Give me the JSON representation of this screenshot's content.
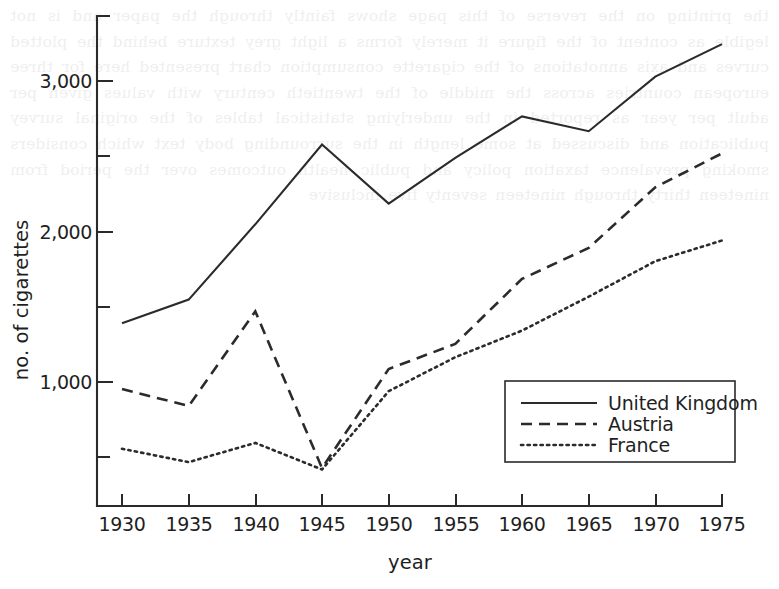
{
  "chart_data": {
    "type": "line",
    "title": "",
    "xlabel": "year",
    "ylabel": "no. of cigarettes",
    "x": [
      1930,
      1935,
      1940,
      1945,
      1950,
      1955,
      1960,
      1965,
      1970,
      1975
    ],
    "xlim": [
      1930,
      1975
    ],
    "ylim": [
      0,
      3500
    ],
    "y_major_ticks": [
      1000,
      2000,
      3000
    ],
    "y_major_tick_labels": [
      "1,000",
      "2,000",
      "3,000"
    ],
    "y_minor_ticks": [
      500,
      1500,
      2500,
      3500
    ],
    "x_tick_labels": [
      "1930",
      "1935",
      "1940",
      "1945",
      "1950",
      "1955",
      "1960",
      "1965",
      "1970",
      "1975"
    ],
    "grid": false,
    "legend_position": "lower right",
    "series": [
      {
        "name": "United Kingdom",
        "style": "solid",
        "values": [
          1420,
          1580,
          2090,
          2630,
          2230,
          2540,
          2820,
          2720,
          3090,
          3310
        ]
      },
      {
        "name": "Austria",
        "style": "dashed",
        "values": [
          975,
          860,
          1500,
          440,
          1110,
          1280,
          1720,
          1930,
          2340,
          2570
        ]
      },
      {
        "name": "France",
        "style": "dotted",
        "values": [
          570,
          480,
          610,
          430,
          960,
          1190,
          1370,
          1600,
          1840,
          1980
        ]
      }
    ]
  },
  "legend": {
    "entries": [
      {
        "label": "United Kingdom",
        "style": "solid"
      },
      {
        "label": "Austria",
        "style": "dashed"
      },
      {
        "label": "France",
        "style": "dotted"
      }
    ]
  },
  "page": {
    "bleed_text": "the printing on the reverse of this page shows faintly through the paper and is not legible as content of the figure it merely forms a light grey texture behind the plotted curves and axis annotations of the cigarette consumption chart presented here for three european countries across the middle of the twentieth century with values given per adult per year as reported in the underlying statistical tables of the original survey publication and discussed at some length in the surrounding body text which considers smoking prevalence taxation policy and public health outcomes over the period from nineteen thirty through nineteen seventy five inclusive"
  }
}
